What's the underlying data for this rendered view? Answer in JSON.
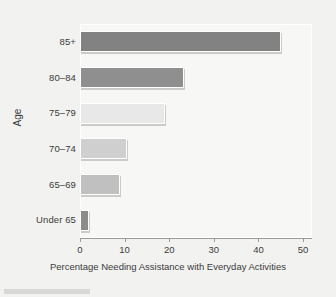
{
  "chart_data": {
    "type": "bar",
    "orientation": "horizontal",
    "title": "",
    "xlabel": "Percentage Needing Assistance with Everyday Activities",
    "ylabel": "Age",
    "categories": [
      "Under 65",
      "65–69",
      "70–74",
      "75–79",
      "80–84",
      "85+"
    ],
    "values": [
      2,
      9,
      10.5,
      19,
      23.3,
      45
    ],
    "xlim": [
      0,
      52
    ],
    "xticks": [
      0,
      10,
      20,
      30,
      40,
      50
    ],
    "xtick_labels": [
      "0",
      "10",
      "20",
      "30",
      "40",
      "50"
    ],
    "grid": false,
    "legend": "none",
    "bar_colors": [
      "#8c8c8c",
      "#c0c0c0",
      "#cfcfcf",
      "#e8e8e8",
      "#8f8f8f",
      "#828282"
    ],
    "panel_color": "#f7f7f5",
    "figure_color": "#f2f2f0",
    "axis_color": "#9a9a9a"
  }
}
